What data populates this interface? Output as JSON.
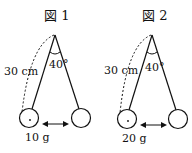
{
  "figures": [
    {
      "title": "図 1",
      "length_label": "30 cm",
      "angle_label": "40°",
      "mass_label": "10 g"
    },
    {
      "title": "図 2",
      "length_label": "30 cm",
      "angle_label": "40°",
      "mass_label": "20 g"
    }
  ],
  "colors": {
    "line": "#111111",
    "background": "#ffffff"
  }
}
